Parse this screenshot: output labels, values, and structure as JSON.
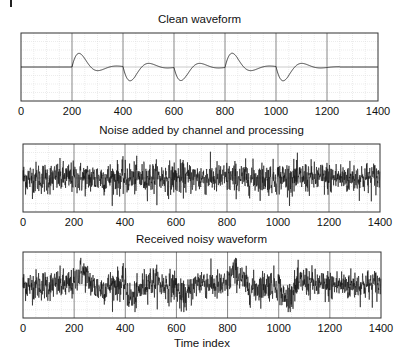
{
  "chart_data": [
    {
      "type": "line",
      "title": "Clean waveform",
      "xlabel": "",
      "ylabel": "",
      "xlim": [
        0,
        1400
      ],
      "xticks": [
        0,
        200,
        400,
        600,
        800,
        1000,
        1200,
        1400
      ],
      "grid": true,
      "description": "Flat baseline with five damped pulses starting at 200 (positive), 400 (negative), 600 (negative), 800 (positive), 1000 (negative)",
      "pulses": [
        {
          "start": 200,
          "sign": 1
        },
        {
          "start": 400,
          "sign": -1
        },
        {
          "start": 600,
          "sign": -1
        },
        {
          "start": 800,
          "sign": 1
        },
        {
          "start": 1000,
          "sign": -1
        }
      ]
    },
    {
      "type": "line",
      "title": "Noise added by channel and processing",
      "xlabel": "",
      "xlim": [
        0,
        1400
      ],
      "xticks": [
        0,
        200,
        400,
        600,
        800,
        1000,
        1200,
        1400
      ],
      "grid": true,
      "description": "Random noise centered at zero, 1400 samples"
    },
    {
      "type": "line",
      "title": "Received noisy waveform",
      "xlabel": "Time index",
      "xlim": [
        0,
        1400
      ],
      "xticks": [
        0,
        200,
        400,
        600,
        800,
        1000,
        1200,
        1400
      ],
      "grid": true,
      "description": "Clean waveform plus noise"
    }
  ],
  "plots": [
    {
      "title": "Clean waveform",
      "ticks": [
        "0",
        "200",
        "400",
        "600",
        "800",
        "1000",
        "1200",
        "1400"
      ]
    },
    {
      "title": "Noise added by channel and processing",
      "ticks": [
        "0",
        "200",
        "400",
        "600",
        "800",
        "1000",
        "1200",
        "1400"
      ]
    },
    {
      "title": "Received noisy waveform",
      "ticks": [
        "0",
        "200",
        "400",
        "600",
        "800",
        "1000",
        "1200",
        "1400"
      ],
      "xlabel": "Time index"
    }
  ]
}
